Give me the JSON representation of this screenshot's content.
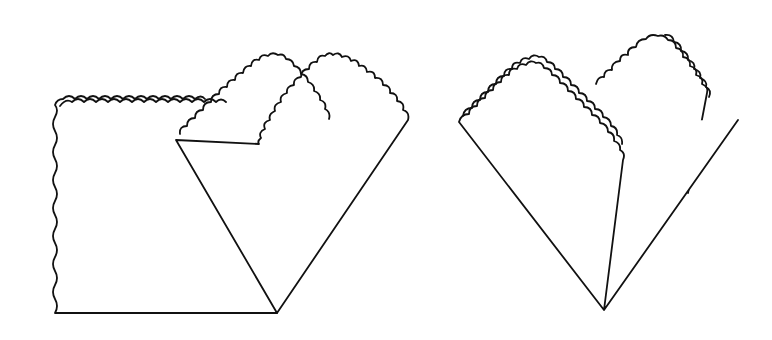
{
  "diagram": {
    "title": "",
    "figures": [
      {
        "id": "step-1",
        "description": "Square napkin with scalloped edges, one corner folded diagonally to form a diamond shape on the right"
      },
      {
        "id": "step-2",
        "description": "Napkin folded into heart shape with layered scalloped top edges"
      }
    ],
    "colors": {
      "stroke": "#111111",
      "background": "#ffffff"
    }
  }
}
